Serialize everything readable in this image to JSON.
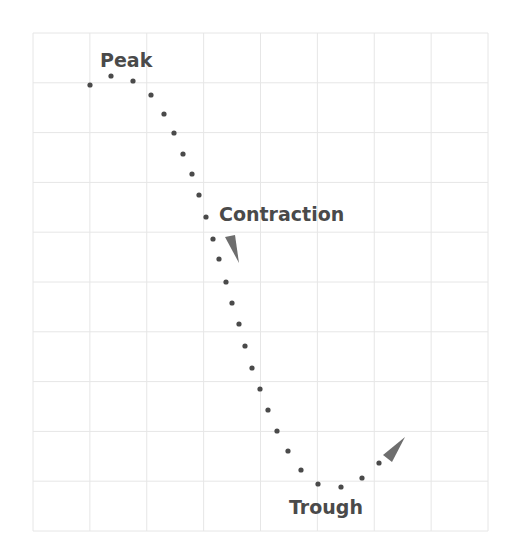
{
  "diagram": {
    "colors": {
      "grid": "#e6e6e6",
      "dots": "#4a4a4a",
      "arrow": "#6e6e6e",
      "text": "#4a4a4a",
      "background": "#ffffff"
    },
    "grid": {
      "left": 33,
      "top": 33,
      "right": 488,
      "bottom": 531,
      "columns": 8,
      "rows": 10
    },
    "labels": {
      "peak": {
        "text": "Peak",
        "x": 100,
        "y": 67
      },
      "contraction": {
        "text": "Contraction",
        "x": 219,
        "y": 221
      },
      "trough": {
        "text": "Trough",
        "x": 289,
        "y": 514
      }
    },
    "arrows": [
      {
        "name": "contraction-arrow",
        "points": "225,237 235,235 239,263"
      },
      {
        "name": "expansion-arrow",
        "points": "383,455 392,462 405,437"
      }
    ],
    "points": [
      [
        90,
        85
      ],
      [
        111,
        76
      ],
      [
        133,
        81
      ],
      [
        151,
        95
      ],
      [
        164,
        114
      ],
      [
        174,
        133
      ],
      [
        183,
        154
      ],
      [
        192,
        174
      ],
      [
        199,
        195
      ],
      [
        206,
        217
      ],
      [
        213,
        239
      ],
      [
        219,
        259
      ],
      [
        226,
        282
      ],
      [
        232,
        303
      ],
      [
        239,
        324
      ],
      [
        245,
        346
      ],
      [
        252,
        368
      ],
      [
        260,
        389
      ],
      [
        268,
        410
      ],
      [
        277,
        431
      ],
      [
        288,
        451
      ],
      [
        301,
        470
      ],
      [
        318,
        484
      ],
      [
        341,
        487
      ],
      [
        362,
        478
      ],
      [
        379,
        463
      ]
    ]
  },
  "chart_data": {
    "type": "scatter",
    "title": "",
    "xlabel": "",
    "ylabel": "",
    "annotations": [
      "Peak",
      "Contraction",
      "Trough"
    ],
    "grid": true,
    "x": [
      90,
      111,
      133,
      151,
      164,
      174,
      183,
      192,
      199,
      206,
      213,
      219,
      226,
      232,
      239,
      245,
      252,
      260,
      268,
      277,
      288,
      301,
      318,
      341,
      362,
      379
    ],
    "y": [
      85,
      76,
      81,
      95,
      114,
      133,
      154,
      174,
      195,
      217,
      239,
      259,
      282,
      303,
      324,
      346,
      368,
      389,
      410,
      431,
      451,
      470,
      484,
      487,
      478,
      463
    ]
  }
}
